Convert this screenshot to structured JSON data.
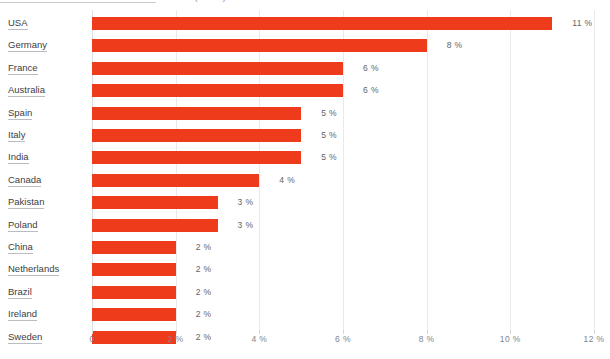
{
  "chart_data": {
    "type": "bar",
    "orientation": "horizontal",
    "title": "London tourists - main home countries (2015)",
    "xlabel": "",
    "ylabel": "",
    "xlim": [
      0,
      12
    ],
    "grid": true,
    "legend": "none",
    "bar_color": "#ee3b1c",
    "categories": [
      "USA",
      "Germany",
      "France",
      "Australia",
      "Spain",
      "Italy",
      "India",
      "Canada",
      "Pakistan",
      "Poland",
      "China",
      "Netherlands",
      "Brazil",
      "Ireland",
      "Sweden"
    ],
    "values": [
      11,
      8,
      6,
      6,
      5,
      5,
      5,
      4,
      3,
      3,
      2,
      2,
      2,
      2,
      2
    ],
    "value_labels": [
      "11 %",
      "8 %",
      "6 %",
      "6 %",
      "5 %",
      "5 %",
      "5 %",
      "4 %",
      "3 %",
      "3 %",
      "2 %",
      "2 %",
      "2 %",
      "2 %",
      "2 %"
    ],
    "xticks": [
      0,
      2,
      4,
      6,
      8,
      10,
      12
    ],
    "xtick_labels": [
      "0",
      "2 %",
      "4 %",
      "6 %",
      "8 %",
      "10 %",
      "12 %"
    ]
  },
  "rows": [
    {
      "label": "USA",
      "value": 11,
      "value_label": "11 %"
    },
    {
      "label": "Germany",
      "value": 8,
      "value_label": "8 %"
    },
    {
      "label": "France",
      "value": 6,
      "value_label": "6 %"
    },
    {
      "label": "Australia",
      "value": 6,
      "value_label": "6 %"
    },
    {
      "label": "Spain",
      "value": 5,
      "value_label": "5 %"
    },
    {
      "label": "Italy",
      "value": 5,
      "value_label": "5 %"
    },
    {
      "label": "India",
      "value": 5,
      "value_label": "5 %"
    },
    {
      "label": "Canada",
      "value": 4,
      "value_label": "4 %"
    },
    {
      "label": "Pakistan",
      "value": 3,
      "value_label": "3 %"
    },
    {
      "label": "Poland",
      "value": 3,
      "value_label": "3 %"
    },
    {
      "label": "China",
      "value": 2,
      "value_label": "2 %"
    },
    {
      "label": "Netherlands",
      "value": 2,
      "value_label": "2 %"
    },
    {
      "label": "Brazil",
      "value": 2,
      "value_label": "2 %"
    },
    {
      "label": "Ireland",
      "value": 2,
      "value_label": "2 %"
    },
    {
      "label": "Sweden",
      "value": 2,
      "value_label": "2 %"
    }
  ],
  "header": {
    "title_cropped": "London tourists - main home countries (2015)"
  },
  "axis": {
    "ticks": [
      "0",
      "2 %",
      "4 %",
      "6 %",
      "8 %",
      "10 %",
      "12 %"
    ]
  }
}
